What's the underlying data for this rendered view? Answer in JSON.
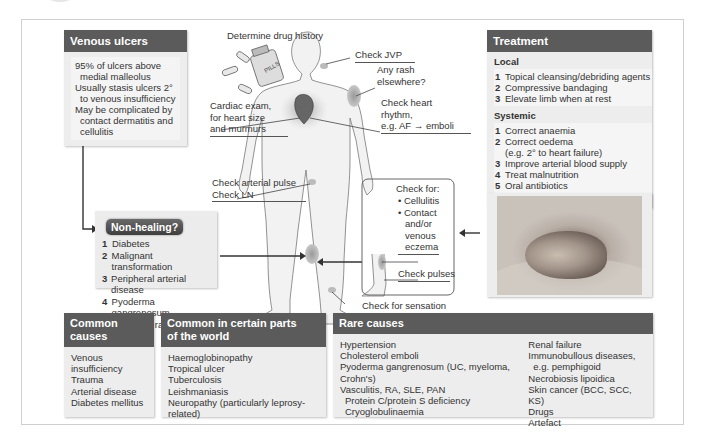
{
  "venous_ulcers": {
    "title": "Venous ulcers",
    "lines": [
      {
        "text": "95% of ulcers above",
        "indent": false
      },
      {
        "text": "medial malleolus",
        "indent": true
      },
      {
        "text": "Usually stasis ulcers 2°",
        "indent": false
      },
      {
        "text": "to venous insufficiency",
        "indent": true
      },
      {
        "text": "May be complicated by",
        "indent": false
      },
      {
        "text": "contact dermatitis and",
        "indent": true
      },
      {
        "text": "cellulitis",
        "indent": true
      }
    ]
  },
  "non_healing": {
    "title": "Non-healing?",
    "items": [
      {
        "num": "1",
        "text": "Diabetes"
      },
      {
        "num": "2",
        "text": "Malignant transformation"
      },
      {
        "num": "3",
        "text": "Peripheral arterial disease"
      },
      {
        "num": "4",
        "text": "Pyoderma gangrenosum",
        "cont": "and other rarities"
      }
    ]
  },
  "body_labels": {
    "drug_history": "Determine drug history",
    "pills_label": "PILLS",
    "check_jvp": "Check JVP",
    "rash": [
      "Any rash",
      "elsewhere?"
    ],
    "heart_rhythm": [
      "Check heart",
      "rhythm,",
      "e.g. AF → emboli"
    ],
    "cardiac_exam": [
      "Cardiac exam,",
      "for heart size",
      "and murmurs"
    ],
    "arterial_pulse": [
      "Check arterial pulse",
      "Check LN"
    ],
    "check_for_title": "Check for:",
    "check_for_items": [
      "Cellulitis",
      "Contact"
    ],
    "check_for_cont": [
      "and/or",
      "venous",
      "eczema"
    ],
    "check_pulses": "Check pulses",
    "check_sensation": "Check for sensation"
  },
  "treatment": {
    "title": "Treatment",
    "local_title": "Local",
    "local": [
      {
        "num": "1",
        "text": "Topical cleansing/debriding agents"
      },
      {
        "num": "2",
        "text": "Compressive bandaging"
      },
      {
        "num": "3",
        "text": "Elevate limb when at rest"
      }
    ],
    "systemic_title": "Systemic",
    "systemic": [
      {
        "num": "1",
        "text": "Correct anaemia"
      },
      {
        "num": "2",
        "text": "Correct oedema",
        "cont": "(e.g. 2° to heart failure)"
      },
      {
        "num": "3",
        "text": "Improve arterial blood supply"
      },
      {
        "num": "4",
        "text": "Treat malnutrition"
      },
      {
        "num": "5",
        "text": "Oral antibiotics"
      }
    ]
  },
  "common_causes": {
    "title": "Common causes",
    "items": [
      "Venous insufficiency",
      "Trauma",
      "Arterial disease",
      "Diabetes mellitus"
    ]
  },
  "world_causes": {
    "title": [
      "Common in certain parts",
      "of the world"
    ],
    "items": [
      "Haemoglobinopathy",
      "Tropical ulcer",
      "Tuberculosis",
      "Leishmaniasis",
      "Neuropathy (particularly leprosy-related)"
    ]
  },
  "rare_causes": {
    "title": "Rare causes",
    "col1": [
      {
        "text": "Hypertension",
        "indent": false
      },
      {
        "text": "Cholesterol emboli",
        "indent": false
      },
      {
        "text": "Pyoderma gangrenosum (UC, myeloma, Crohn's)",
        "indent": false
      },
      {
        "text": "Vasculitis, RA, SLE, PAN",
        "indent": false
      },
      {
        "text": "Protein C/protein S deficiency",
        "indent": true
      },
      {
        "text": "Cryoglobulinaemia",
        "indent": true
      }
    ],
    "col2": [
      {
        "text": "Renal failure",
        "indent": false
      },
      {
        "text": "Immunobullous diseases,",
        "indent": false
      },
      {
        "text": "e.g. pemphigoid",
        "indent": true
      },
      {
        "text": "Necrobiosis lipoidica",
        "indent": false
      },
      {
        "text": "Skin cancer (BCC, SCC, KS)",
        "indent": false
      },
      {
        "text": "Drugs",
        "indent": false
      },
      {
        "text": "Artefact",
        "indent": false
      }
    ]
  },
  "colors": {
    "header_bg": "#5b5b5b",
    "box_bg": "#ededed",
    "frame_border": "#cfcfcf"
  }
}
